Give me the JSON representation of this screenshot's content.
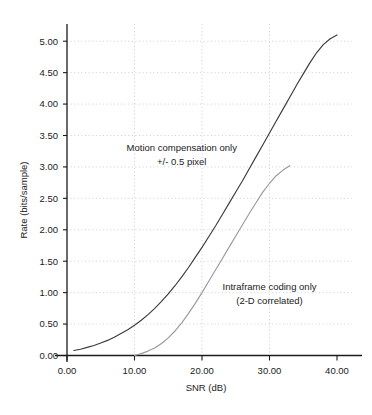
{
  "chart_data": {
    "type": "line",
    "title": "",
    "xlabel": "SNR (dB)",
    "ylabel": "Rate (bits/sample)",
    "xlim": [
      0,
      40
    ],
    "ylim": [
      0,
      5.25
    ],
    "xticks": [
      0,
      10,
      20,
      30,
      40
    ],
    "xtick_labels": [
      "0.00",
      "10.00",
      "20.00",
      "30.00",
      "40.00"
    ],
    "yticks": [
      0,
      0.5,
      1.0,
      1.5,
      2.0,
      2.5,
      3.0,
      3.5,
      4.0,
      4.5,
      5.0
    ],
    "ytick_labels": [
      "0.00",
      "0.50",
      "1.00",
      "1.50",
      "2.00",
      "2.50",
      "3.00",
      "3.50",
      "4.00",
      "4.50",
      "5.00"
    ],
    "grid": true,
    "grid_style": "dotted",
    "legend_position": "inline-annotations",
    "series": [
      {
        "name": "Motion compensation only +/- 0.5 pixel",
        "color": "#3b3b3b",
        "width": 1.15,
        "x": [
          1.0,
          2.0,
          3.0,
          4.0,
          5.0,
          6.0,
          7.0,
          8.0,
          9.0,
          10.0,
          11.0,
          12.0,
          13.0,
          14.0,
          15.0,
          16.0,
          17.0,
          18.0,
          19.0,
          20.0,
          21.0,
          22.0,
          23.0,
          24.0,
          25.0,
          26.0,
          27.0,
          28.0,
          29.0,
          30.0,
          31.0,
          32.0,
          33.0,
          34.0,
          35.0,
          36.0,
          37.0,
          38.0,
          39.0,
          40.0
        ],
        "y": [
          0.08,
          0.1,
          0.13,
          0.16,
          0.2,
          0.24,
          0.29,
          0.35,
          0.41,
          0.48,
          0.56,
          0.65,
          0.75,
          0.86,
          0.98,
          1.11,
          1.25,
          1.4,
          1.56,
          1.72,
          1.89,
          2.06,
          2.24,
          2.42,
          2.6,
          2.78,
          2.97,
          3.16,
          3.35,
          3.54,
          3.73,
          3.92,
          4.11,
          4.3,
          4.48,
          4.66,
          4.82,
          4.95,
          5.04,
          5.1
        ]
      },
      {
        "name": "Intraframe coding only (2-D correlated)",
        "color": "#9a9a9a",
        "width": 1.15,
        "x": [
          10.0,
          11.0,
          12.0,
          13.0,
          14.0,
          15.0,
          16.0,
          17.0,
          18.0,
          19.0,
          20.0,
          21.0,
          22.0,
          23.0,
          24.0,
          25.0,
          26.0,
          27.0,
          28.0,
          29.0,
          30.0,
          31.0,
          32.0,
          33.0
        ],
        "y": [
          0.0,
          0.03,
          0.07,
          0.12,
          0.19,
          0.28,
          0.39,
          0.52,
          0.67,
          0.83,
          1.0,
          1.18,
          1.36,
          1.54,
          1.72,
          1.9,
          2.08,
          2.26,
          2.43,
          2.6,
          2.74,
          2.86,
          2.95,
          3.02
        ]
      }
    ],
    "annotations": [
      {
        "name": "motion-compensation-label",
        "lines": [
          "Motion compensation only",
          "+/- 0.5 pixel"
        ],
        "x": 17.0,
        "y": 3.25
      },
      {
        "name": "intraframe-label",
        "lines": [
          "Intraframe coding only",
          "(2-D correlated)"
        ],
        "x": 30.0,
        "y": 1.05
      }
    ],
    "colors": {
      "axis": "#1b1b1b",
      "grid": "#b9b9b9",
      "series_dark": "#3b3b3b",
      "series_light": "#9a9a9a",
      "background": "#ffffff"
    }
  }
}
